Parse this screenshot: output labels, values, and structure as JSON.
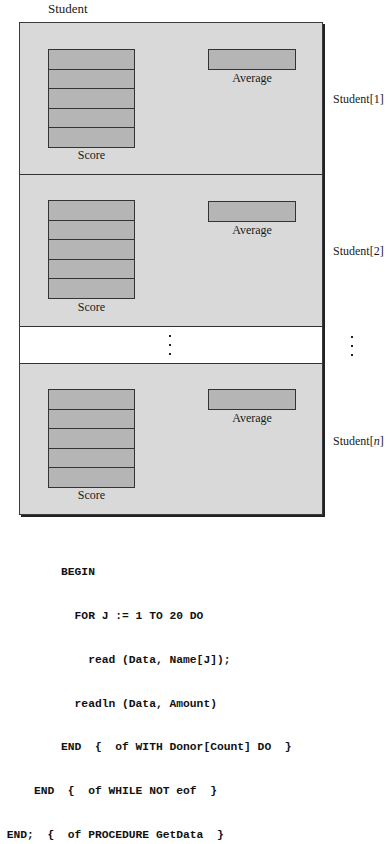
{
  "diagram": {
    "title": "Student",
    "records": [
      {
        "label_prefix": "Student[",
        "index": "1",
        "label_suffix": "]",
        "score_label": "Score",
        "average_label": "Average",
        "score_cells": 5
      },
      {
        "label_prefix": "Student[",
        "index": "2",
        "label_suffix": "]",
        "score_label": "Score",
        "average_label": "Average",
        "score_cells": 5
      },
      {
        "label_prefix": "Student[",
        "index": "n",
        "label_suffix": "]",
        "score_label": "Score",
        "average_label": "Average",
        "score_cells": 5
      }
    ],
    "ellipsis": "⋮",
    "colors": {
      "panel_fill": "#d9d9d9",
      "box_fill": "#b5b5b5",
      "border": "#333333",
      "gap_fill": "#ffffff"
    }
  },
  "code": {
    "lines": [
      "         BEGIN",
      "           FOR J := 1 TO 20 DO",
      "             read (Data, Name[J]);",
      "           readln (Data, Amount)",
      "         END  {  of WITH Donor[Count] DO  }",
      "     END  {  of WHILE NOT eof  }",
      " END;  {  of PROCEDURE GetData  }"
    ]
  }
}
